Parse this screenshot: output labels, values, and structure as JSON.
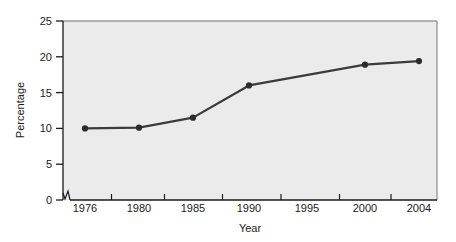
{
  "chart_data": {
    "type": "line",
    "title": "",
    "xlabel": "Year",
    "ylabel": "Percentage",
    "x": [
      1976,
      1980,
      1985,
      1990,
      2000,
      2004
    ],
    "values": [
      10.0,
      10.1,
      11.5,
      16.0,
      18.9,
      19.4
    ],
    "series": [
      {
        "name": "Percentage",
        "values": [
          10.0,
          10.1,
          11.5,
          16.0,
          18.9,
          19.4
        ]
      }
    ],
    "x_tick_labels": [
      "1976",
      "1980",
      "1985",
      "1990",
      "1995",
      "2000",
      "2004"
    ],
    "x_tick_values": [
      1976,
      1980,
      1985,
      1990,
      1995,
      2000,
      2004
    ],
    "y_tick_labels": [
      "0",
      "5",
      "10",
      "15",
      "20",
      "25"
    ],
    "y_tick_values": [
      0,
      5,
      10,
      15,
      20,
      25
    ],
    "ylim": [
      0,
      25
    ],
    "xlim": [
      1974,
      2005.5
    ],
    "grid": false,
    "legend": "none",
    "axis_break": "x-axis origin break (zigzag)",
    "colors": {
      "line": "#3a3a3a",
      "marker": "#2b2b2b",
      "plot_background": "#ebebeb",
      "plot_border": "#9a9a9a",
      "axis": "#1a1a1a",
      "page_background": "#ffffff"
    }
  }
}
